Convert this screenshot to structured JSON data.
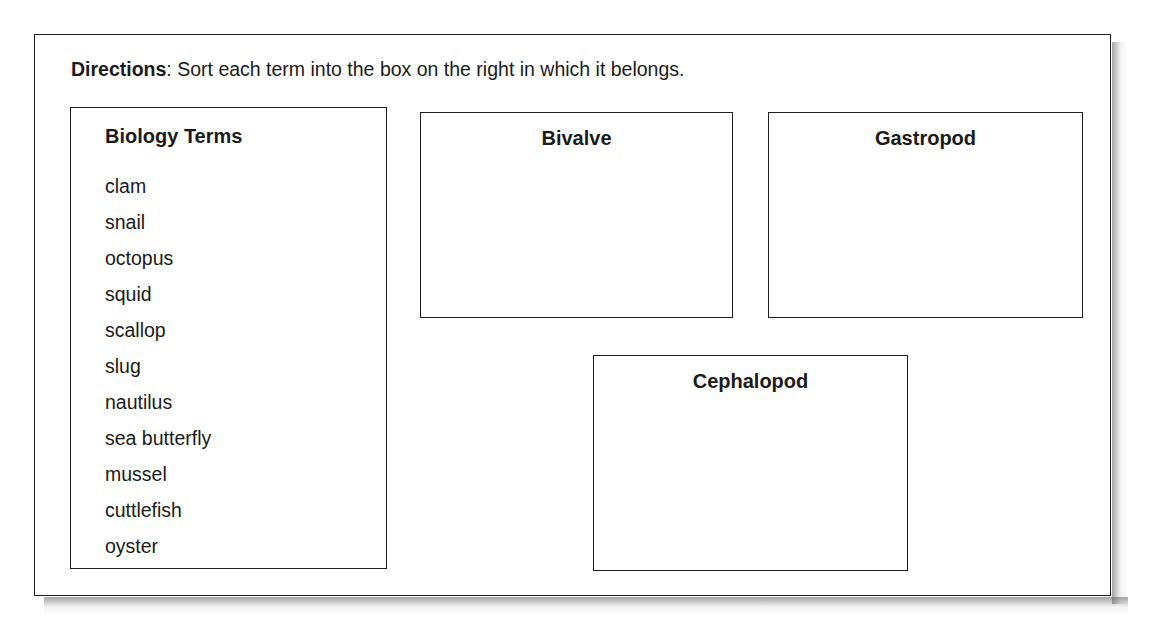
{
  "worksheet": {
    "directions": {
      "label": "Directions",
      "text": ": Sort each term into the box on the right in which it belongs."
    },
    "terms_bank": {
      "title": "Biology Terms",
      "terms": [
        "clam",
        "snail",
        "octopus",
        "squid",
        "scallop",
        "slug",
        "nautilus",
        "sea butterfly",
        "mussel",
        "cuttlefish",
        "oyster"
      ]
    },
    "categories": [
      {
        "title": "Bivalve",
        "contents": []
      },
      {
        "title": "Gastropod",
        "contents": []
      },
      {
        "title": "Cephalopod",
        "contents": []
      }
    ],
    "colors": {
      "border": "#1d1d1d",
      "text": "#1a1a1a",
      "background": "#ffffff"
    }
  }
}
